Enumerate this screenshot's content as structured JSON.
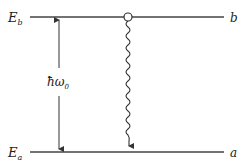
{
  "diagram": {
    "levels": {
      "upper": {
        "energy_label": "E",
        "energy_sub": "b",
        "state_label": "b",
        "y": 17
      },
      "lower": {
        "energy_label": "E",
        "energy_sub": "a",
        "state_label": "a",
        "y": 152
      }
    },
    "energy_gap": {
      "label": "ħω",
      "label_sub": "0"
    },
    "transition": {
      "type": "spontaneous-emission",
      "from": "b",
      "to": "a",
      "style": "wavy-arrow"
    },
    "colors": {
      "line": "#444444",
      "text": "#222222",
      "background": "#ffffff"
    }
  }
}
